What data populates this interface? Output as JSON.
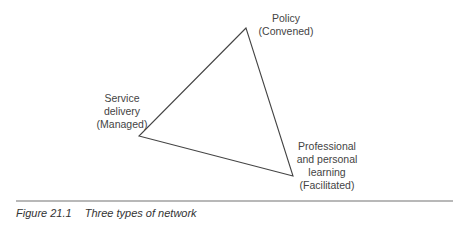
{
  "figure": {
    "number": "Figure 21.1",
    "title": "Three types of network"
  },
  "diagram": {
    "shape": "triangle",
    "stroke_color": "#444444",
    "nodes": [
      {
        "id": "policy",
        "lines": [
          "Policy",
          "(Convened)"
        ],
        "vertex": [
          246,
          28
        ]
      },
      {
        "id": "service",
        "lines": [
          "Service",
          "delivery",
          "(Managed)"
        ],
        "vertex": [
          139,
          136
        ]
      },
      {
        "id": "professional",
        "lines": [
          "Professional",
          "and personal",
          "learning",
          "(Facilitated)"
        ],
        "vertex": [
          293,
          176
        ]
      }
    ]
  },
  "rule_color": "#b8b8b8"
}
